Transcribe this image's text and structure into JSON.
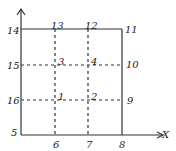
{
  "diagram": {
    "type": "grid-of-numbered-points",
    "axis_label_x": "X",
    "points": [
      {
        "id": "1",
        "label": "1",
        "x": 58,
        "y": 92
      },
      {
        "id": "2",
        "label": "2",
        "x": 91,
        "y": 92
      },
      {
        "id": "3",
        "label": "3",
        "x": 58,
        "y": 57
      },
      {
        "id": "4",
        "label": "4",
        "x": 91,
        "y": 57
      },
      {
        "id": "5",
        "label": "5",
        "x": 11,
        "y": 128
      },
      {
        "id": "6",
        "label": "6",
        "x": 53,
        "y": 140
      },
      {
        "id": "7",
        "label": "7",
        "x": 86,
        "y": 140
      },
      {
        "id": "8",
        "label": "8",
        "x": 119,
        "y": 140
      },
      {
        "id": "9",
        "label": "9",
        "x": 127,
        "y": 96
      },
      {
        "id": "10",
        "label": "10",
        "x": 126,
        "y": 60
      },
      {
        "id": "11",
        "label": "11",
        "x": 125,
        "y": 25
      },
      {
        "id": "12",
        "label": "12",
        "x": 85,
        "y": 21
      },
      {
        "id": "13",
        "label": "13",
        "x": 51,
        "y": 21
      },
      {
        "id": "14",
        "label": "14",
        "x": 7,
        "y": 26
      },
      {
        "id": "15",
        "label": "15",
        "x": 7,
        "y": 61
      },
      {
        "id": "16",
        "label": "16",
        "x": 7,
        "y": 96
      }
    ],
    "colors": {
      "line": "#333333",
      "background": "#ffffff"
    }
  }
}
